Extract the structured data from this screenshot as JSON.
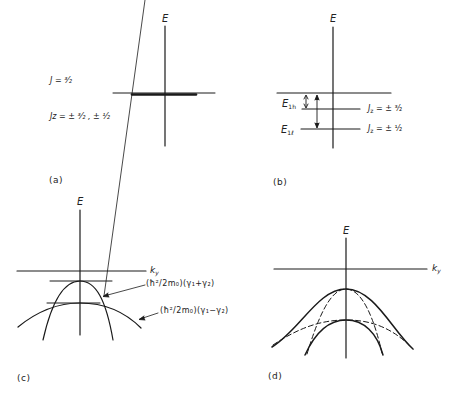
{
  "panels": {
    "a": {
      "caption": "(a)",
      "axis_label": "E",
      "j_label": "J = ³⁄₂",
      "jz_label": "Jz = ± ³⁄₂ , ± ¹⁄₂"
    },
    "b": {
      "caption": "(b)",
      "axis_label": "E",
      "e1h_label": "E",
      "e1h_sub": "1h",
      "e1l_label": "E",
      "e1l_sub": "1ℓ",
      "jz_heavy": "= ± ³⁄₂",
      "jz_light": "= ± ¹⁄₂",
      "jz_symbol": "J",
      "jz_sub": "z"
    },
    "c": {
      "caption": "(c)",
      "axis_label": "E",
      "k_label": "k",
      "k_sub": "y",
      "curve1_label": "(ħ²/2m₀)(γ₁+γ₂)",
      "curve2_label": "(ħ²/2m₀)(γ₁−γ₂)"
    },
    "d": {
      "caption": "(d)",
      "axis_label": "E",
      "k_label": "k",
      "k_sub": "y"
    }
  },
  "colors": {
    "line": "#1a1a1a",
    "background": "#ffffff"
  }
}
